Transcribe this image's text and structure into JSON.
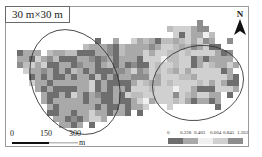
{
  "title": "30 m×30 m",
  "north_arrow": {
    "label": "N"
  },
  "scale_bar": {
    "ticks": [
      "0",
      "150",
      "300"
    ],
    "unit": "m"
  },
  "legend": {
    "breaks": [
      "0",
      "0.228",
      "0.403",
      "0.604",
      "0.845",
      "1.263"
    ],
    "classes": [
      {
        "range": "0–0.228",
        "color": "#6e6e6e"
      },
      {
        "range": "0.228–0.403",
        "color": "#a9a9a9"
      },
      {
        "range": "0.403–0.604",
        "color": "#f0f0f0"
      },
      {
        "range": "0.604–0.845",
        "color": "#d0d0d0"
      },
      {
        "range": "0.845–1.263",
        "color": "#8d8d8d"
      }
    ]
  },
  "map": {
    "cell_size_px": 6,
    "palette": {
      "1": "#6e6e6e",
      "2": "#a9a9a9",
      "3": "#f0f0f0",
      "4": "#d0d0d0",
      "5": "#8d8d8d",
      "6": "#bdbdbd"
    },
    "rows": [
      "..............................5.........",
      ".........................6444255........",
      "..........................4142236.......",
      ".............1..2..42621662642452..5....",
      "...........62225162222524462652411......",
      "1222.6226611122516222424466464444215....",
      "221425611122515212221444366441212222....",
      "5642411221522126121511464464412462242...",
      ".42252121621211155245246462424444412....",
      "..12121121221612122555424446624444421...",
      "..42212222224121111246224644446424211...",
      "...2121111224121221444644434421114442...",
      "....211214212511214664444454624422.1....",
      "....212222212211211243244464212212......",
      ".....21222222121121224...4.......1......",
      ".....11221224221221.1...................",
      "......221512442.........................",
      ".......2212.1..........................."
    ]
  },
  "ellipses": [
    {
      "name": "left-cluster",
      "cx": 75,
      "cy": 82,
      "rx": 42,
      "ry": 55,
      "rotate": -28
    },
    {
      "name": "right-cluster",
      "cx": 198,
      "cy": 83,
      "rx": 46,
      "ry": 37,
      "rotate": -14
    }
  ]
}
